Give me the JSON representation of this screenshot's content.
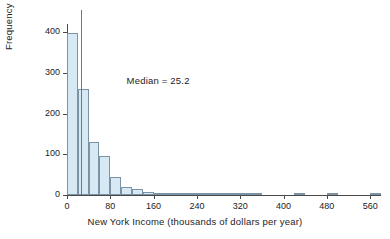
{
  "chart_data": {
    "type": "bar",
    "title": "",
    "xlabel": "New York Income (thousands of dollars per year)",
    "ylabel": "Frequency",
    "xlim": [
      0,
      580
    ],
    "ylim": [
      0,
      420
    ],
    "bin_width": 20,
    "grid": false,
    "legend": null,
    "xticks": [
      0,
      80,
      160,
      240,
      320,
      400,
      480,
      560
    ],
    "yticks": [
      0,
      100,
      200,
      300,
      400
    ],
    "bin_starts": [
      0,
      20,
      40,
      60,
      80,
      100,
      120,
      140,
      160,
      180,
      200,
      220,
      240,
      260,
      280,
      300,
      320,
      340,
      360,
      380,
      400,
      420,
      440,
      460,
      480,
      500,
      520,
      540,
      560
    ],
    "values": [
      397,
      260,
      131,
      97,
      45,
      20,
      14,
      8,
      4,
      3,
      3,
      2,
      2,
      1,
      1,
      1,
      4,
      1,
      0,
      0,
      0,
      1,
      0,
      0,
      4,
      0,
      0,
      0,
      2
    ],
    "categories": [
      "0-20",
      "20-40",
      "40-60",
      "60-80",
      "80-100",
      "100-120",
      "120-140",
      "140-160",
      "160-180",
      "180-200",
      "200-220",
      "220-240",
      "240-260",
      "260-280",
      "280-300",
      "300-320",
      "320-340",
      "340-360",
      "360-380",
      "380-400",
      "400-420",
      "420-440",
      "440-460",
      "460-480",
      "480-500",
      "500-520",
      "520-540",
      "540-560",
      "560-580"
    ],
    "annotations": [
      {
        "name": "median-annotation",
        "text": "Median = 25.2",
        "value": 25.2
      }
    ],
    "reference_lines": [
      {
        "name": "median-line",
        "orientation": "vertical",
        "value": 25.2,
        "color": "#e8453c"
      }
    ],
    "colors": {
      "bar_fill": "#d7e9f4",
      "bar_edge": "#7b93a5",
      "median": "#e8453c",
      "axis": "#4a4a4a",
      "text": "#1c1c1c",
      "background": "#ffffff"
    }
  }
}
